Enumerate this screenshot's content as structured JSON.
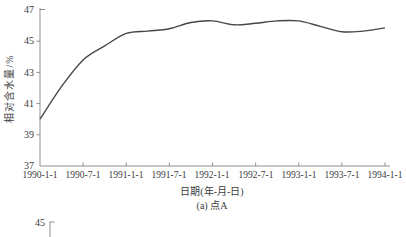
{
  "figure": {
    "bg_color": "#ffffff",
    "axis_color": "#8f8f8f",
    "line_color": "#474747",
    "text_color": "#3b3b3b"
  },
  "chart_data": {
    "type": "line",
    "title": "",
    "xlabel": "日期(年-月-日)",
    "ylabel": "相对含水量/%",
    "caption": "(a) 点A",
    "ylim": [
      37,
      47
    ],
    "grid": false,
    "legend": "none",
    "y_ticks": [
      "47",
      "45",
      "43",
      "41",
      "39",
      "37"
    ],
    "x_tick_labels": [
      "1990-1-1",
      "1990-7-1",
      "1991-1-1",
      "1991-7-1",
      "1992-1-1",
      "1992-7-1",
      "1993-1-1",
      "1993-7-1",
      "1994-1-1"
    ],
    "series": [
      {
        "name": "点A",
        "x": [
          "1990-1-1",
          "1990-4-1",
          "1990-7-1",
          "1990-10-1",
          "1991-1-1",
          "1991-4-1",
          "1991-7-1",
          "1991-10-1",
          "1992-1-1",
          "1992-4-1",
          "1992-7-1",
          "1992-10-1",
          "1993-1-1",
          "1993-4-1",
          "1993-7-1",
          "1993-10-1",
          "1994-1-1"
        ],
        "values": [
          40.0,
          42.1,
          43.8,
          44.7,
          45.5,
          45.65,
          45.8,
          46.2,
          46.3,
          46.05,
          46.15,
          46.3,
          46.3,
          45.95,
          45.6,
          45.65,
          45.85
        ]
      }
    ]
  },
  "next_chart_fragment": {
    "y_tick_label": "45"
  }
}
